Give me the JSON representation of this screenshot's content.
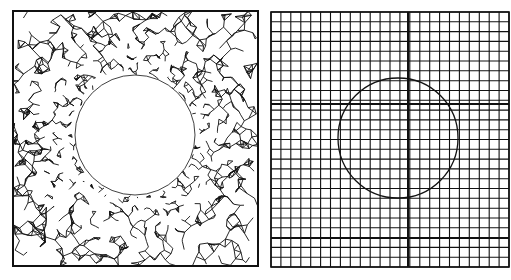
{
  "figure": {
    "background": "#ffffff",
    "ink": "#111111",
    "panels": [
      {
        "id": "unstructured-mesh",
        "kind": "triangular-unstructured-mesh",
        "box": {
          "x": 13,
          "y": 11,
          "w": 245,
          "h": 255
        },
        "hole": {
          "cx": 135,
          "cy": 135,
          "r": 60
        },
        "density": "refined near hole boundary, coarser at outer edges"
      },
      {
        "id": "cartesian-grid",
        "kind": "cartesian-grid-with-embedded-circle",
        "box": {
          "x": 271,
          "y": 12,
          "w": 238,
          "h": 255
        },
        "grid_lines_x": 24,
        "grid_lines_y": 26,
        "thick_lines_x": [
          408
        ],
        "thick_lines_y": [
          104,
          238
        ],
        "circle": {
          "cx": 398,
          "cy": 138,
          "r": 60
        }
      }
    ]
  }
}
